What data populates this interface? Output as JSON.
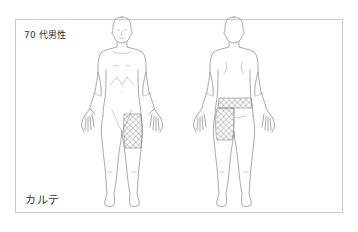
{
  "card": {
    "patient_label": "70 代男性",
    "footer_label": "カルテ"
  },
  "figures": [
    {
      "view": "front",
      "highlighted_regions": [
        "left-thigh"
      ]
    },
    {
      "view": "back",
      "highlighted_regions": [
        "lower-back-band",
        "left-thigh"
      ]
    }
  ],
  "colors": {
    "border": "#c9c9c9",
    "outline": "#6f6f6f",
    "hatch": "#555555",
    "text": "#333333"
  }
}
